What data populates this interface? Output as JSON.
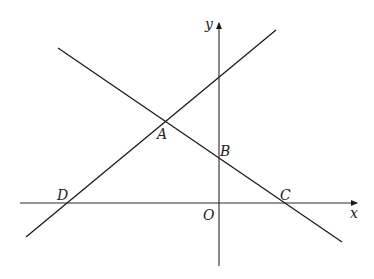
{
  "diagram": {
    "type": "coordinate-geometry",
    "axes": {
      "x_label": "x",
      "y_label": "y",
      "origin_label": "O"
    },
    "points": [
      {
        "label": "A",
        "description": "intersection of the two lines"
      },
      {
        "label": "B",
        "description": "intersection of line AC with y-axis"
      },
      {
        "label": "C",
        "description": "intersection of line AC with x-axis"
      },
      {
        "label": "D",
        "description": "intersection of line DA with x-axis"
      }
    ],
    "lines": [
      {
        "name": "line-DA",
        "through": [
          "D",
          "A"
        ],
        "slope": "positive"
      },
      {
        "name": "line-AC",
        "through": [
          "A",
          "B",
          "C"
        ],
        "slope": "negative"
      }
    ],
    "colors": {
      "stroke": "#1a1a1a",
      "background": "#ffffff"
    }
  }
}
